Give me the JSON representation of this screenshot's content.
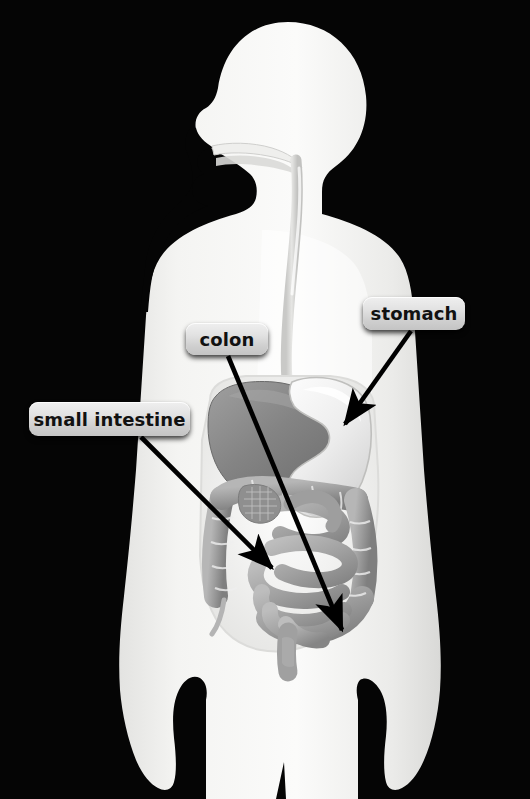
{
  "scene": {
    "title": "Human digestive system diagram",
    "background_color": "#050505",
    "body_color": "#f2f2f0",
    "width": 530,
    "height": 799
  },
  "labels": [
    {
      "id": "stomach",
      "text": "stomach",
      "x": 363,
      "y": 297,
      "w": 102,
      "h": 33,
      "arrow_from": [
        411,
        331
      ],
      "arrow_to": [
        341,
        429
      ]
    },
    {
      "id": "colon",
      "text": "colon",
      "x": 186,
      "y": 323,
      "w": 82,
      "h": 32,
      "arrow_from": [
        228,
        356
      ],
      "arrow_to": [
        345,
        636
      ]
    },
    {
      "id": "small-intestine",
      "text": "small intestine",
      "x": 29,
      "y": 402,
      "w": 161,
      "h": 34,
      "arrow_from": [
        141,
        437
      ],
      "arrow_to": [
        277,
        574
      ]
    }
  ],
  "organs": [
    {
      "id": "esophagus",
      "name": "esophagus",
      "tone": "#d8d8d6"
    },
    {
      "id": "liver",
      "name": "liver",
      "tone": "#8d8d8d"
    },
    {
      "id": "stomach-organ",
      "name": "stomach",
      "tone": "#e9e9e9"
    },
    {
      "id": "small-intestine-organ",
      "name": "small intestine",
      "tone": "#a5a5a5"
    },
    {
      "id": "colon-organ",
      "name": "colon",
      "tone": "#9a9a9a"
    },
    {
      "id": "rectum",
      "name": "rectum",
      "tone": "#a0a0a0"
    }
  ],
  "style": {
    "label_background_top": "#efefef",
    "label_background_bottom": "#c4c4c4",
    "label_text_color": "#111111",
    "arrow_color": "#000000"
  }
}
